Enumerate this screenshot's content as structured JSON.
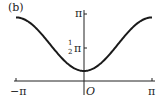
{
  "panel_label": "(b)",
  "chart_data": {
    "type": "line",
    "title": "(b)",
    "xlabel": "",
    "ylabel": "",
    "xlim": [
      -3.14159,
      3.14159
    ],
    "ylim": [
      0,
      3.14159
    ],
    "x_ticks": [
      "−π",
      "O",
      "π"
    ],
    "y_ticks": [
      "½π",
      "π"
    ],
    "origin_label": "O",
    "series": [
      {
        "name": "curve",
        "x": [
          -3.14159,
          -2.356,
          -1.571,
          -0.785,
          0,
          0.785,
          1.571,
          2.356,
          3.14159
        ],
        "y": [
          2.98,
          2.62,
          1.67,
          0.83,
          0.47,
          0.83,
          1.67,
          2.62,
          2.98
        ]
      }
    ],
    "grid": false,
    "legend": "none"
  },
  "labels": {
    "x_neg_pi": "−π",
    "x_pi": "π",
    "origin": "O",
    "y_pi": "π",
    "y_half_num": "1",
    "y_half_den": "2",
    "y_half_pi": "π"
  }
}
